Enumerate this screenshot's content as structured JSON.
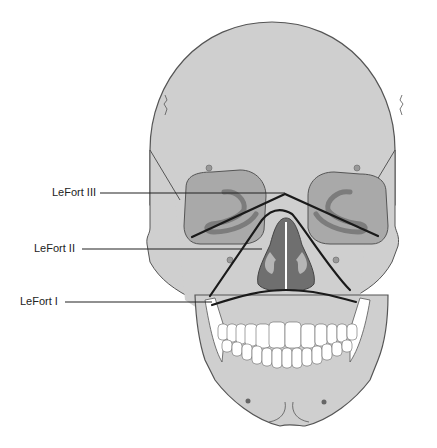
{
  "diagram": {
    "colors": {
      "bone": "#cfcfcf",
      "bone_outline": "#555555",
      "orbit": "#a9a9a9",
      "orbit_inner": "#7c7c7c",
      "nasal": "#6f6f6f",
      "nasal_light": "#b5b5b5",
      "teeth": "#ffffff",
      "fracture_line": "#1a1a1a",
      "background": "#ffffff"
    },
    "labels": [
      {
        "id": "lefort-3",
        "text": "LeFort III"
      },
      {
        "id": "lefort-2",
        "text": "LeFort II"
      },
      {
        "id": "lefort-1",
        "text": "LeFort I"
      }
    ]
  }
}
